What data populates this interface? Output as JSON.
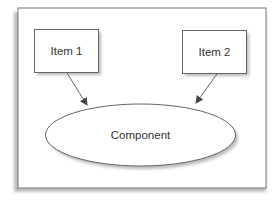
{
  "diagram": {
    "nodes": [
      {
        "id": "item1",
        "label": "Item 1",
        "shape": "rectangle"
      },
      {
        "id": "item2",
        "label": "Item 2",
        "shape": "rectangle"
      },
      {
        "id": "component",
        "label": "Component",
        "shape": "ellipse"
      }
    ],
    "edges": [
      {
        "from": "item1",
        "to": "component",
        "arrow": "end"
      },
      {
        "from": "item2",
        "to": "component",
        "arrow": "end"
      }
    ],
    "colors": {
      "stroke": "#666666",
      "text": "#333333",
      "shadow": "#bbbbbb",
      "background": "#ffffff"
    }
  }
}
